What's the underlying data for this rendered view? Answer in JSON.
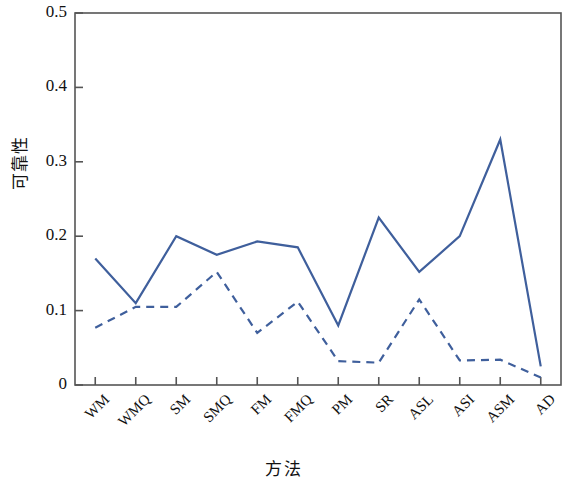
{
  "chart_data": {
    "type": "line",
    "title": "",
    "xlabel": "方法",
    "ylabel": "可靠性",
    "categories": [
      "WM",
      "WMQ",
      "SM",
      "SMQ",
      "FM",
      "FMQ",
      "PM",
      "SR",
      "ASL",
      "ASI",
      "ASM",
      "AD"
    ],
    "ylim": [
      0,
      0.5
    ],
    "ytick_labels": [
      "0",
      "0.1",
      "0.2",
      "0.3",
      "0.4",
      "0.5"
    ],
    "ytick_values": [
      0,
      0.1,
      0.2,
      0.3,
      0.4,
      0.5
    ],
    "grid": false,
    "legend": "none",
    "series": [
      {
        "name": "solid",
        "style": "solid",
        "color": "#3f5f9c",
        "values": [
          0.17,
          0.11,
          0.2,
          0.175,
          0.193,
          0.185,
          0.08,
          0.225,
          0.152,
          0.2,
          0.33,
          0.025
        ]
      },
      {
        "name": "dashed",
        "style": "dashed",
        "color": "#3f5f9c",
        "values": [
          0.077,
          0.105,
          0.105,
          0.152,
          0.07,
          0.112,
          0.032,
          0.03,
          0.115,
          0.033,
          0.034,
          0.01
        ]
      }
    ],
    "axis_color": "#555555",
    "plot_box": {
      "left": 75,
      "top": 13,
      "right": 561,
      "bottom": 385
    }
  }
}
